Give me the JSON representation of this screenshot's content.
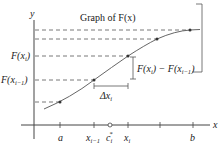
{
  "title": "Graph of F(x)",
  "axes": {
    "x_label": "x",
    "y_label": "y"
  },
  "x_ticks": [
    {
      "id": "a",
      "label": "a"
    },
    {
      "id": "xim1",
      "label": "x",
      "sub": "i−1"
    },
    {
      "id": "ci",
      "label": "c",
      "sub": "i",
      "sup": "*"
    },
    {
      "id": "xi",
      "label": "x",
      "sub": "i"
    },
    {
      "id": "b",
      "label": "b"
    }
  ],
  "y_labels": [
    {
      "id": "Fxi",
      "label": "F(x",
      "sub": "i",
      "close": ")"
    },
    {
      "id": "Fxim1",
      "label": "F(x",
      "sub": "i−1",
      "close": ")"
    }
  ],
  "annotations": {
    "delta_x": {
      "label": "Δx",
      "sub": "i"
    },
    "difference": {
      "label": "F(x",
      "sub1": "i",
      "mid": ") − F(x",
      "sub2": "i−1",
      "end": ")"
    }
  },
  "colors": {
    "curve": "#666666",
    "axis": "#444444",
    "dashes": "#555555",
    "text": "#222222"
  }
}
